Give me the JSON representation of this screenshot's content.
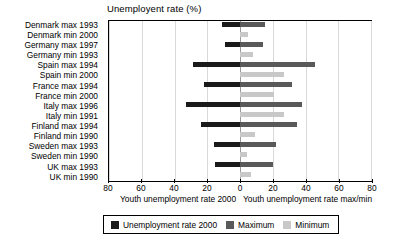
{
  "chart_data": {
    "type": "bar",
    "title": "Unemployent rate (%)",
    "orientation": "horizontal",
    "style": "diverging-bidirectional",
    "xlabel_left": "Youth unemployment rate 2000",
    "xlabel_right": "Youth unemployment rate max/min",
    "ylabel": "",
    "grid": true,
    "legend_position": "bottom",
    "axis": {
      "left_ticks": [
        80,
        60,
        40,
        20,
        0
      ],
      "right_ticks": [
        0,
        20,
        40,
        60,
        80
      ],
      "tick_labels": [
        "80",
        "60",
        "40",
        "20",
        "0",
        "20",
        "40",
        "60",
        "80"
      ],
      "xlim_left": [
        0,
        80
      ],
      "xlim_right": [
        0,
        80
      ]
    },
    "categories": [
      "Denmark max 1993",
      "Denmark min 2000",
      "Germany max 1997",
      "Germany min 1993",
      "Spain max 1994",
      "Spain min 2000",
      "France max 1994",
      "France min 2000",
      "Italy max 1996",
      "Italy min 1991",
      "Finland max 1994",
      "Finland min 1990",
      "Sweden max 1993",
      "Sweden min 1990",
      "UK max 1993",
      "UK min 1990"
    ],
    "series": [
      {
        "name": "Unemployment rate 2000",
        "color": "#1a1a1a",
        "side": "left",
        "values": [
          11,
          0,
          9,
          0,
          29,
          0,
          22,
          0,
          33,
          0,
          24,
          0,
          16,
          0,
          15,
          0
        ]
      },
      {
        "name": "Maximum",
        "color": "#595959",
        "side": "right",
        "values": [
          15,
          0,
          14,
          0,
          46,
          0,
          32,
          0,
          38,
          0,
          35,
          0,
          22,
          0,
          20,
          0
        ]
      },
      {
        "name": "Minimum",
        "color": "#c8c8c8",
        "side": "right",
        "values": [
          0,
          5,
          0,
          8,
          0,
          27,
          0,
          21,
          0,
          27,
          0,
          9,
          0,
          4,
          0,
          7
        ]
      }
    ],
    "rows": [
      {
        "label": "Denmark max 1993",
        "left": 11,
        "right_max": 15,
        "right_min": null
      },
      {
        "label": "Denmark min 2000",
        "left": null,
        "right_max": null,
        "right_min": 5
      },
      {
        "label": "Germany max 1997",
        "left": 9,
        "right_max": 14,
        "right_min": null
      },
      {
        "label": "Germany min 1993",
        "left": null,
        "right_max": null,
        "right_min": 8
      },
      {
        "label": "Spain max 1994",
        "left": 29,
        "right_max": 46,
        "right_min": null
      },
      {
        "label": "Spain min 2000",
        "left": null,
        "right_max": null,
        "right_min": 27
      },
      {
        "label": "France max 1994",
        "left": 22,
        "right_max": 32,
        "right_min": null
      },
      {
        "label": "France min 2000",
        "left": null,
        "right_max": null,
        "right_min": 21
      },
      {
        "label": "Italy max 1996",
        "left": 33,
        "right_max": 38,
        "right_min": null
      },
      {
        "label": "Italy min 1991",
        "left": null,
        "right_max": null,
        "right_min": 27
      },
      {
        "label": "Finland max 1994",
        "left": 24,
        "right_max": 35,
        "right_min": null
      },
      {
        "label": "Finland min 1990",
        "left": null,
        "right_max": null,
        "right_min": 9
      },
      {
        "label": "Sweden max 1993",
        "left": 16,
        "right_max": 22,
        "right_min": null
      },
      {
        "label": "Sweden min 1990",
        "left": null,
        "right_max": null,
        "right_min": 4
      },
      {
        "label": "UK max 1993",
        "left": 15,
        "right_max": 20,
        "right_min": null
      },
      {
        "label": "UK min 1990",
        "left": null,
        "right_max": null,
        "right_min": 7
      }
    ]
  },
  "legend": {
    "items": [
      {
        "label": "Unemployment rate 2000",
        "color": "#1a1a1a"
      },
      {
        "label": "Maximum",
        "color": "#595959"
      },
      {
        "label": "Minimum",
        "color": "#c8c8c8"
      }
    ]
  }
}
